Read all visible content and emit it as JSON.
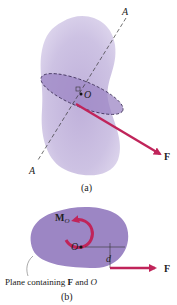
{
  "figure_a": {
    "axis_label_top": "A",
    "axis_label_bottom": "A",
    "point_label": "O",
    "force_label": "F",
    "caption": "(a)"
  },
  "figure_b": {
    "moment_label_main": "M",
    "moment_label_sub": "O",
    "point_label": "O",
    "distance_label": "d",
    "force_label": "F",
    "plane_caption_pre": "Plane containing ",
    "plane_caption_F": "F",
    "plane_caption_mid": " and ",
    "plane_caption_O": "O",
    "caption": "(b)"
  },
  "colors": {
    "body": "#c9bde0",
    "plane": "#9c86c4",
    "force": "#c0245a"
  }
}
